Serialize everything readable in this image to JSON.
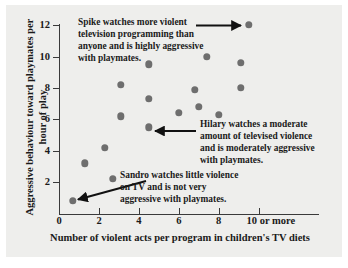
{
  "chart_data": {
    "type": "scatter",
    "title": "",
    "xlabel": "Number of violent acts per program in children's TV diets",
    "ylabel": "Aggressive behaviour toward playmates per hour of play",
    "xlim": [
      0,
      10.6
    ],
    "ylim": [
      0,
      12.6
    ],
    "grid": false,
    "legend": "none",
    "xticks": [
      {
        "value": 0,
        "label": "0"
      },
      {
        "value": 2,
        "label": "2"
      },
      {
        "value": 4,
        "label": "4"
      },
      {
        "value": 6,
        "label": "6"
      },
      {
        "value": 8,
        "label": "8"
      },
      {
        "value": 10,
        "label": "10 or more"
      }
    ],
    "yticks": [
      {
        "value": 2,
        "label": "2"
      },
      {
        "value": 4,
        "label": "4"
      },
      {
        "value": 6,
        "label": "6"
      },
      {
        "value": 8,
        "label": "8"
      },
      {
        "value": 10,
        "label": "10"
      },
      {
        "value": 12,
        "label": "12"
      }
    ],
    "marker": {
      "shape": "circle",
      "color": "#6e6e6e",
      "size": 7.4
    },
    "points": [
      {
        "x": 0.7,
        "y": 0.8,
        "label": "Sandro"
      },
      {
        "x": 1.3,
        "y": 3.2
      },
      {
        "x": 2.3,
        "y": 4.2
      },
      {
        "x": 2.7,
        "y": 2.2
      },
      {
        "x": 3.1,
        "y": 8.2
      },
      {
        "x": 3.1,
        "y": 6.2
      },
      {
        "x": 4.5,
        "y": 9.5
      },
      {
        "x": 4.5,
        "y": 7.3
      },
      {
        "x": 4.5,
        "y": 5.5,
        "label": "Hilary"
      },
      {
        "x": 6.0,
        "y": 6.4
      },
      {
        "x": 6.8,
        "y": 7.9
      },
      {
        "x": 7.4,
        "y": 10.0
      },
      {
        "x": 7.0,
        "y": 6.8
      },
      {
        "x": 8.0,
        "y": 6.3
      },
      {
        "x": 9.1,
        "y": 9.6
      },
      {
        "x": 9.1,
        "y": 8.0
      },
      {
        "x": 9.5,
        "y": 12.0,
        "label": "Spike"
      }
    ],
    "annotations": [
      {
        "id": "spike",
        "text": "Spike watches more violent television programming than anyone and is highly aggressive with playmates.",
        "points_to": {
          "x": 9.5,
          "y": 12.0
        },
        "arrow_direction": "right"
      },
      {
        "id": "hilary",
        "text": "Hilary watches a moderate amount of televised violence and is moderately aggressive with playmates.",
        "points_to": {
          "x": 4.5,
          "y": 5.5
        },
        "arrow_direction": "left"
      },
      {
        "id": "sandro",
        "text": "Sandro watches little violence on TV and is not very aggressive with playmates.",
        "points_to": {
          "x": 0.7,
          "y": 0.8
        },
        "arrow_direction": "down-left"
      }
    ]
  },
  "colors": {
    "page_background": "#ffffff",
    "panel_background": "#eeeeec",
    "axis": "#3a3a3a",
    "text": "#1a1a1a",
    "marker": "#6e6e6e",
    "arrow": "#111111"
  }
}
